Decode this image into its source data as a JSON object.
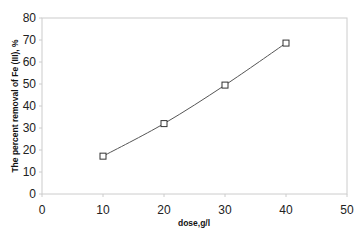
{
  "chart_data": {
    "type": "line",
    "title": "",
    "xlabel": "dose,g/l",
    "ylabel": "The percent removal of Fe (III), %",
    "x": [
      10,
      20,
      30,
      40
    ],
    "series": [
      {
        "name": "Fe (III) removal",
        "values": [
          17.2,
          32,
          49.5,
          68.6
        ],
        "marker": "square",
        "color": "#555555"
      }
    ],
    "xlim": [
      0,
      50
    ],
    "ylim": [
      0,
      80
    ],
    "xticks": [
      "0",
      "10",
      "20",
      "30",
      "40",
      "50"
    ],
    "yticks": [
      "0",
      "10",
      "20",
      "30",
      "40",
      "50",
      "60",
      "70",
      "80"
    ],
    "grid": false,
    "legend": "none"
  }
}
